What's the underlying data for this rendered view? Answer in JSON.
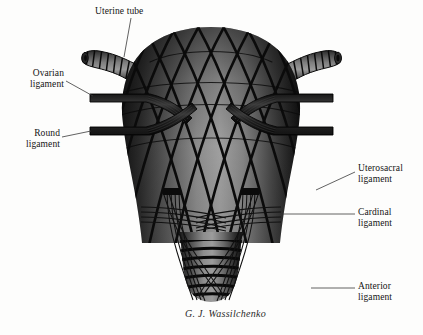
{
  "figure": {
    "background_color": "#fdfdfc",
    "ink_color": "#141414",
    "signature": "G. J. Wassilchenko"
  },
  "labels": [
    {
      "id": "uterine-tube",
      "text_line1": "Uterine tube",
      "text_line2": "",
      "x": 95,
      "y": 6,
      "align": "left"
    },
    {
      "id": "ovarian-ligament",
      "text_line1": "Ovarian",
      "text_line2": "ligament",
      "x": 22,
      "y": 68,
      "align": "right"
    },
    {
      "id": "round-ligament",
      "text_line1": "Round",
      "text_line2": "ligament",
      "x": 16,
      "y": 128,
      "align": "right"
    },
    {
      "id": "uterosacral-ligament",
      "text_line1": "Uterosacral",
      "text_line2": "ligament",
      "x": 358,
      "y": 163,
      "align": "left"
    },
    {
      "id": "cardinal-ligament",
      "text_line1": "Cardinal",
      "text_line2": "ligament",
      "x": 358,
      "y": 207,
      "align": "left"
    },
    {
      "id": "anterior-ligament",
      "text_line1": "Anterior",
      "text_line2": "ligament",
      "x": 358,
      "y": 281,
      "align": "left"
    }
  ],
  "signature": {
    "text": "G. J. Wassilchenko",
    "x": 185,
    "y": 308
  },
  "anatomy": {
    "parts": [
      "uterine tube (left)",
      "uterine tube (right)",
      "fundus of uterus",
      "body of uterus",
      "cervix",
      "ovarian ligament (left)",
      "ovarian ligament (right)",
      "round ligament (left)",
      "round ligament (right)",
      "uterosacral ligament",
      "cardinal ligament",
      "anterior ligament"
    ]
  }
}
